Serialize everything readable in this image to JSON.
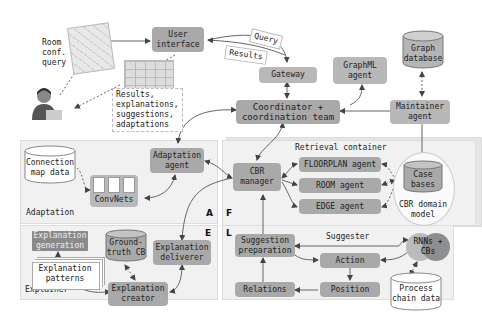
{
  "user_side": {
    "room_query_label": "Room\nconf.\nquery",
    "results_note": "Results,\nexplanations,\nsuggestions,\nadaptations"
  },
  "top": {
    "user_interface": "User\ninterface",
    "query_tag": "Query",
    "results_tag": "Results",
    "gateway": "Gateway",
    "graphml_agent": "GraphML\nagent",
    "graph_database": "Graph\ndatabase",
    "coordinator": "Coordinator +\ncoordination team",
    "maintainer_agent": "Maintainer\nagent"
  },
  "adaptation": {
    "region_label": "Adaptation",
    "corner_label": "A",
    "connection_map_data": "Connection\nmap data",
    "convnets": "ConvNets",
    "adaptation_agent": "Adaptation\nagent"
  },
  "retrieval": {
    "region_label": "Retrieval container",
    "corner_label": "F",
    "cbr_manager": "CBR\nmanager",
    "floorplan_agent": "FLOORPLAN agent",
    "room_agent": "ROOM agent",
    "edge_agent": "EDGE agent",
    "case_bases": "Case\nbases",
    "cbr_domain_model": "CBR domain\nmodel"
  },
  "explainer": {
    "region_label": "Explainer",
    "corner_label": "E",
    "explanation_generation": "Explanation\ngeneration",
    "explanation_patterns": "Explanation\npatterns",
    "ground_truth_cb": "Ground-\ntruth CB",
    "explanation_deliverer": "Explanation\ndeliverer",
    "explanation_creator": "Explanation\ncreator"
  },
  "suggester": {
    "region_label": "Suggester",
    "corner_label": "L",
    "suggestion_preparation": "Suggestion\npreparation",
    "action": "Action",
    "relations": "Relations",
    "position": "Position",
    "rnns_cbs": "RNNs +\nCBs",
    "process_chain_data": "Process\nchain data"
  },
  "colors": {
    "box_fill": "#a9a9a9",
    "region_fill": "#f1f1f1",
    "arrow": "#555555"
  }
}
